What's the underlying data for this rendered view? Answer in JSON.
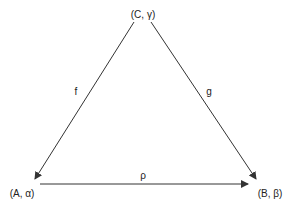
{
  "diagram": {
    "type": "commutative-triangle",
    "nodes": [
      {
        "id": "C",
        "label": "(C, γ)",
        "x": 143,
        "y": 14
      },
      {
        "id": "A",
        "label": "(A, α)",
        "x": 22,
        "y": 192
      },
      {
        "id": "B",
        "label": "(B, β)",
        "x": 270,
        "y": 192
      }
    ],
    "edges": [
      {
        "id": "f",
        "label": "f",
        "from": "C",
        "to": "A"
      },
      {
        "id": "g",
        "label": "g",
        "from": "C",
        "to": "B"
      },
      {
        "id": "rho",
        "label": "ρ",
        "from": "A",
        "to": "B"
      }
    ],
    "colors": {
      "line": "#333333",
      "text": "#222222",
      "background": "#ffffff"
    }
  }
}
